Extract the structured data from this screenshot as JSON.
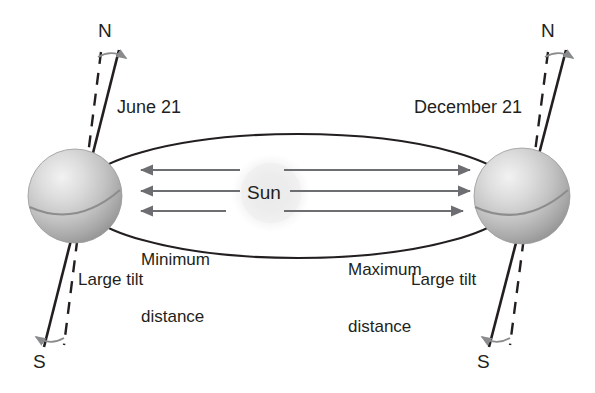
{
  "diagram": {
    "type": "astronomy-orbit-diagram",
    "background_color": "#ffffff",
    "line_color": "#231f20",
    "arrow_color": "#6d6e71",
    "sphere_color": "#b5b5b5",
    "sun_color": "#e8e8e8"
  },
  "sun": {
    "label": "Sun"
  },
  "left_planet": {
    "north_label": "N",
    "south_label": "S",
    "date_label": "June 21",
    "tilt_label": "Large tilt",
    "rotation_icon": "rotation-arrow-icon"
  },
  "right_planet": {
    "north_label": "N",
    "south_label": "S",
    "date_label": "December 21",
    "tilt_label": "Large tilt",
    "rotation_icon": "rotation-arrow-icon"
  },
  "distances": {
    "minimum_label": "Minimum\ndistance",
    "minimum_line1": "Minimum",
    "minimum_line2": "distance",
    "maximum_label": "Maximum\ndistance",
    "maximum_line1": "Maximum",
    "maximum_line2": "distance",
    "minimum_arrow_count": 3,
    "maximum_arrow_count": 3,
    "minimum_arrow_direction": "left",
    "maximum_arrow_direction": "right"
  },
  "orbit": {
    "shape": "ellipse",
    "stroke_color": "#231f20"
  }
}
